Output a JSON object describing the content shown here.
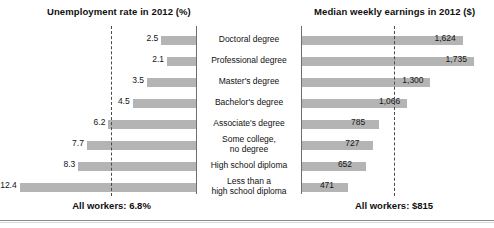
{
  "titles": {
    "left": "Unemployment rate in 2012 (%)",
    "right": "Median weekly earnings in 2012 ($)"
  },
  "footers": {
    "left": "All workers: 6.8%",
    "right": "All workers: $815"
  },
  "categories": [
    "Doctoral degree",
    "Professional degree",
    "Master's degree",
    "Bachelor's degree",
    "Associate's degree",
    "Some college,\nno degree",
    "High school diploma",
    "Less than a\nhigh school diploma"
  ],
  "left_labels": [
    "2.5",
    "2.1",
    "3.5",
    "4.5",
    "6.2",
    "7.7",
    "8.3",
    "12.4"
  ],
  "right_labels": [
    "1,624",
    "1,735",
    "1,300",
    "1,066",
    "785",
    "727",
    "652",
    "471"
  ],
  "colors": {
    "bar": "#b4b4b4",
    "axis": "#6e6e6e",
    "refline": "#4a4a4a",
    "text": "#111111",
    "background": "#ffffff"
  },
  "chart_data": {
    "type": "bar",
    "orientation": "horizontal",
    "layout": "back-to-back (butterfly) paired bar charts sharing centered category labels",
    "grid": false,
    "legend": null,
    "categories": [
      "Doctoral degree",
      "Professional degree",
      "Master's degree",
      "Bachelor's degree",
      "Associate's degree",
      "Some college, no degree",
      "High school diploma",
      "Less than a high school diploma"
    ],
    "series": [
      {
        "name": "Unemployment rate in 2012 (%)",
        "panel": "left",
        "direction": "right-to-left",
        "unit": "%",
        "values": [
          2.5,
          2.1,
          3.5,
          4.5,
          6.2,
          7.7,
          8.3,
          12.4
        ],
        "data_labels": [
          "2.5",
          "2.1",
          "3.5",
          "4.5",
          "6.2",
          "7.7",
          "8.3",
          "12.4"
        ],
        "xlim": [
          0,
          13.5
        ],
        "reference_line": {
          "label": "All workers: 6.8%",
          "value": 6.8,
          "style": "dashed"
        }
      },
      {
        "name": "Median weekly earnings in 2012 ($)",
        "panel": "right",
        "direction": "left-to-right",
        "unit": "$",
        "values": [
          1624,
          1735,
          1300,
          1066,
          785,
          727,
          652,
          471
        ],
        "data_labels": [
          "1,624",
          "1,735",
          "1,300",
          "1,066",
          "785",
          "727",
          "652",
          "471"
        ],
        "xlim": [
          0,
          1900
        ],
        "reference_line": {
          "label": "All workers: $815",
          "value": 815,
          "style": "dashed"
        }
      }
    ]
  }
}
